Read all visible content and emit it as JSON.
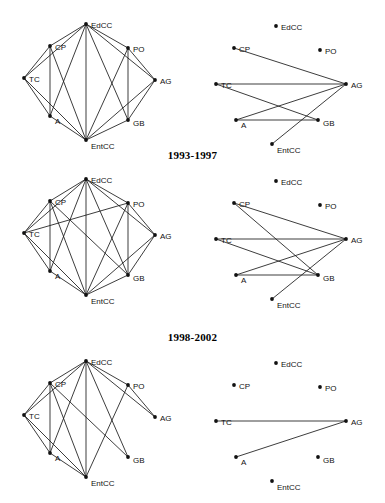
{
  "running_head": {
    "title": "DYNAMICS OF POLICY NETWORKS",
    "page": "77"
  },
  "figure": {
    "node_labels": {
      "EdCC": "EdCC",
      "CP": "CP",
      "PO": "PO",
      "TC": "TC",
      "AG": "AG",
      "A": "A",
      "GB": "GB",
      "EntCC": "EntCC"
    },
    "panels": [
      {
        "id": "panel-1988-1992",
        "title": "",
        "title_visible": false,
        "left_graph": {
          "name": "communication-network",
          "edges": [
            [
              "EdCC",
              "CP"
            ],
            [
              "EdCC",
              "PO"
            ],
            [
              "EdCC",
              "TC"
            ],
            [
              "EdCC",
              "AG"
            ],
            [
              "EdCC",
              "A"
            ],
            [
              "EdCC",
              "GB"
            ],
            [
              "EdCC",
              "EntCC"
            ],
            [
              "CP",
              "TC"
            ],
            [
              "CP",
              "A"
            ],
            [
              "CP",
              "EntCC"
            ],
            [
              "TC",
              "A"
            ],
            [
              "TC",
              "EntCC"
            ],
            [
              "A",
              "EntCC"
            ],
            [
              "PO",
              "AG"
            ],
            [
              "PO",
              "GB"
            ],
            [
              "PO",
              "EntCC"
            ],
            [
              "AG",
              "GB"
            ],
            [
              "AG",
              "EntCC"
            ],
            [
              "GB",
              "EntCC"
            ]
          ]
        },
        "right_graph": {
          "name": "resource-exchange-network",
          "edges": [
            [
              "CP",
              "AG"
            ],
            [
              "TC",
              "AG"
            ],
            [
              "TC",
              "GB"
            ],
            [
              "A",
              "AG"
            ],
            [
              "A",
              "GB"
            ],
            [
              "EntCC",
              "AG"
            ]
          ]
        }
      },
      {
        "id": "panel-1993-1997",
        "title": "1993-1997",
        "title_visible": true,
        "left_graph": {
          "name": "communication-network",
          "edges": [
            [
              "EdCC",
              "CP"
            ],
            [
              "EdCC",
              "PO"
            ],
            [
              "EdCC",
              "TC"
            ],
            [
              "EdCC",
              "AG"
            ],
            [
              "EdCC",
              "A"
            ],
            [
              "EdCC",
              "GB"
            ],
            [
              "EdCC",
              "EntCC"
            ],
            [
              "CP",
              "TC"
            ],
            [
              "CP",
              "A"
            ],
            [
              "CP",
              "EntCC"
            ],
            [
              "TC",
              "A"
            ],
            [
              "TC",
              "EntCC"
            ],
            [
              "TC",
              "PO"
            ],
            [
              "A",
              "EntCC"
            ],
            [
              "PO",
              "AG"
            ],
            [
              "PO",
              "GB"
            ],
            [
              "PO",
              "EntCC"
            ],
            [
              "AG",
              "GB"
            ],
            [
              "AG",
              "EntCC"
            ],
            [
              "GB",
              "EntCC"
            ],
            [
              "CP",
              "GB"
            ]
          ]
        },
        "right_graph": {
          "name": "resource-exchange-network",
          "edges": [
            [
              "CP",
              "AG"
            ],
            [
              "CP",
              "GB"
            ],
            [
              "TC",
              "AG"
            ],
            [
              "TC",
              "GB"
            ],
            [
              "A",
              "AG"
            ],
            [
              "A",
              "GB"
            ],
            [
              "EntCC",
              "AG"
            ]
          ]
        }
      },
      {
        "id": "panel-1998-2002",
        "title": "1998-2002",
        "title_visible": true,
        "left_graph": {
          "name": "communication-network",
          "edges": [
            [
              "EdCC",
              "CP"
            ],
            [
              "EdCC",
              "PO"
            ],
            [
              "EdCC",
              "TC"
            ],
            [
              "EdCC",
              "A"
            ],
            [
              "EdCC",
              "GB"
            ],
            [
              "EdCC",
              "EntCC"
            ],
            [
              "EdCC",
              "AG"
            ],
            [
              "CP",
              "TC"
            ],
            [
              "CP",
              "A"
            ],
            [
              "CP",
              "EntCC"
            ],
            [
              "TC",
              "A"
            ],
            [
              "TC",
              "EntCC"
            ],
            [
              "A",
              "EntCC"
            ],
            [
              "PO",
              "AG"
            ],
            [
              "PO",
              "EntCC"
            ],
            [
              "CP",
              "GB"
            ]
          ]
        },
        "right_graph": {
          "name": "resource-exchange-network",
          "edges": [
            [
              "TC",
              "AG"
            ],
            [
              "A",
              "AG"
            ]
          ]
        }
      }
    ],
    "node_positions_left": {
      "EdCC": [
        78,
        16
      ],
      "CP": [
        42,
        38
      ],
      "PO": [
        120,
        40
      ],
      "TC": [
        16,
        70
      ],
      "AG": [
        147,
        72
      ],
      "A": [
        42,
        108
      ],
      "GB": [
        120,
        112
      ],
      "EntCC": [
        78,
        132
      ]
    },
    "node_positions_right": {
      "EdCC": [
        78,
        18
      ],
      "CP": [
        36,
        40
      ],
      "PO": [
        122,
        42
      ],
      "TC": [
        18,
        76
      ],
      "AG": [
        148,
        76
      ],
      "A": [
        38,
        112
      ],
      "GB": [
        120,
        112
      ],
      "EntCC": [
        74,
        136
      ]
    },
    "label_offsets": {
      "EdCC": [
        5,
        4
      ],
      "CP": [
        5,
        4
      ],
      "PO": [
        5,
        4
      ],
      "TC": [
        5,
        4
      ],
      "AG": [
        5,
        4
      ],
      "A": [
        5,
        8
      ],
      "GB": [
        5,
        6
      ],
      "EntCC": [
        5,
        9
      ]
    },
    "style": {
      "edge_color": "#1a1a1a",
      "node_color": "#111111",
      "background": "#ffffff"
    }
  }
}
